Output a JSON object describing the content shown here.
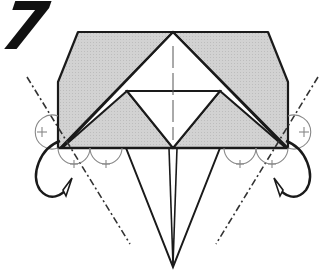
{
  "step": {
    "number": "7"
  },
  "diagram": {
    "type": "origami-fold-instruction",
    "colors": {
      "paper_back": "#cfcfcf",
      "paper_front": "#ffffff",
      "line": "#1a1a1a",
      "guide": "#8a8a8a"
    },
    "elements": [
      "hexagonal-folded-shape",
      "central-triangle-flap",
      "inner-inverted-triangle",
      "center-crease-line",
      "left-mountain-fold-line",
      "right-mountain-fold-line",
      "left-fold-behind-arrow",
      "right-fold-behind-arrow",
      "angle-bisector-marks",
      "bottom-kite-flap"
    ]
  }
}
